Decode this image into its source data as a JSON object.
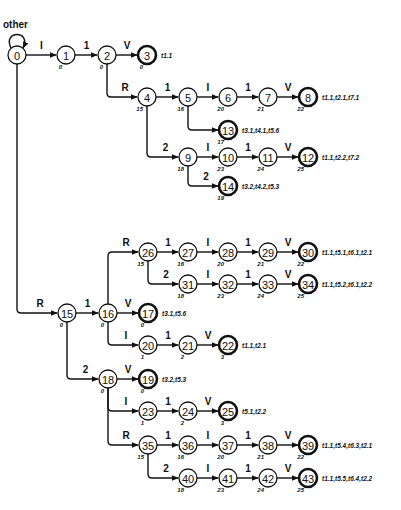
{
  "diagram": {
    "type": "finite-state-automaton",
    "self_loop_label": "other",
    "node_radius": 9,
    "colors": {
      "stroke": "#111111",
      "fill": "#ffffff",
      "text": "#111111"
    },
    "nodes": [
      {
        "id": "0",
        "x": 17,
        "y": 55,
        "sub": "",
        "final": false,
        "out": ""
      },
      {
        "id": "1",
        "x": 66,
        "y": 55,
        "sub": "0",
        "final": false,
        "out": ""
      },
      {
        "id": "2",
        "x": 107,
        "y": 55,
        "sub": "0",
        "final": false,
        "out": ""
      },
      {
        "id": "3",
        "x": 147,
        "y": 55,
        "sub": "0",
        "final": true,
        "out": "t1.1"
      },
      {
        "id": "4",
        "x": 147,
        "y": 97,
        "sub": "15",
        "final": false,
        "out": ""
      },
      {
        "id": "5",
        "x": 188,
        "y": 97,
        "sub": "16",
        "final": false,
        "out": ""
      },
      {
        "id": "6",
        "x": 228,
        "y": 97,
        "sub": "20",
        "final": false,
        "out": ""
      },
      {
        "id": "7",
        "x": 268,
        "y": 97,
        "sub": "21",
        "final": false,
        "out": ""
      },
      {
        "id": "8",
        "x": 308,
        "y": 97,
        "sub": "22",
        "final": true,
        "out": "t1.1,t2.1,t7.1"
      },
      {
        "id": "13",
        "x": 228,
        "y": 130,
        "sub": "17",
        "final": true,
        "out": "t3.1,t4.1,t5.6"
      },
      {
        "id": "9",
        "x": 188,
        "y": 157,
        "sub": "18",
        "final": false,
        "out": ""
      },
      {
        "id": "10",
        "x": 228,
        "y": 157,
        "sub": "23",
        "final": false,
        "out": ""
      },
      {
        "id": "11",
        "x": 268,
        "y": 157,
        "sub": "24",
        "final": false,
        "out": ""
      },
      {
        "id": "12",
        "x": 308,
        "y": 157,
        "sub": "25",
        "final": true,
        "out": "t1.1,t2.2,t7.2"
      },
      {
        "id": "14",
        "x": 228,
        "y": 186,
        "sub": "19",
        "final": true,
        "out": "t3.2,t4.2,t5.3"
      },
      {
        "id": "15",
        "x": 67,
        "y": 313,
        "sub": "0",
        "final": false,
        "out": ""
      },
      {
        "id": "16",
        "x": 108,
        "y": 313,
        "sub": "0",
        "final": false,
        "out": ""
      },
      {
        "id": "17",
        "x": 148,
        "y": 313,
        "sub": "0",
        "final": true,
        "out": "t3.1,t5.6"
      },
      {
        "id": "26",
        "x": 148,
        "y": 252,
        "sub": "15",
        "final": false,
        "out": ""
      },
      {
        "id": "27",
        "x": 188,
        "y": 252,
        "sub": "16",
        "final": false,
        "out": ""
      },
      {
        "id": "28",
        "x": 228,
        "y": 252,
        "sub": "20",
        "final": false,
        "out": ""
      },
      {
        "id": "29",
        "x": 268,
        "y": 252,
        "sub": "21",
        "final": false,
        "out": ""
      },
      {
        "id": "30",
        "x": 308,
        "y": 252,
        "sub": "22",
        "final": true,
        "out": "t1.1,t5.1,t6.1,t2.1"
      },
      {
        "id": "31",
        "x": 188,
        "y": 284,
        "sub": "18",
        "final": false,
        "out": ""
      },
      {
        "id": "32",
        "x": 228,
        "y": 284,
        "sub": "23",
        "final": false,
        "out": ""
      },
      {
        "id": "33",
        "x": 268,
        "y": 284,
        "sub": "24",
        "final": false,
        "out": ""
      },
      {
        "id": "34",
        "x": 308,
        "y": 284,
        "sub": "25",
        "final": true,
        "out": "t1.1,t5.2,t6.1,t2.2"
      },
      {
        "id": "20",
        "x": 148,
        "y": 345,
        "sub": "1",
        "final": false,
        "out": ""
      },
      {
        "id": "21",
        "x": 188,
        "y": 345,
        "sub": "2",
        "final": false,
        "out": ""
      },
      {
        "id": "22",
        "x": 228,
        "y": 345,
        "sub": "3",
        "final": true,
        "out": "t1.1,t2.1"
      },
      {
        "id": "18",
        "x": 108,
        "y": 379,
        "sub": "0",
        "final": false,
        "out": ""
      },
      {
        "id": "19",
        "x": 148,
        "y": 379,
        "sub": "0",
        "final": true,
        "out": "t3.2,t5.3"
      },
      {
        "id": "23",
        "x": 148,
        "y": 411,
        "sub": "1",
        "final": false,
        "out": ""
      },
      {
        "id": "24",
        "x": 188,
        "y": 411,
        "sub": "2",
        "final": false,
        "out": ""
      },
      {
        "id": "25",
        "x": 228,
        "y": 411,
        "sub": "3",
        "final": true,
        "out": "t5.1,t2.2"
      },
      {
        "id": "35",
        "x": 148,
        "y": 445,
        "sub": "15",
        "final": false,
        "out": ""
      },
      {
        "id": "36",
        "x": 188,
        "y": 445,
        "sub": "16",
        "final": false,
        "out": ""
      },
      {
        "id": "37",
        "x": 228,
        "y": 445,
        "sub": "20",
        "final": false,
        "out": ""
      },
      {
        "id": "38",
        "x": 268,
        "y": 445,
        "sub": "21",
        "final": false,
        "out": ""
      },
      {
        "id": "39",
        "x": 308,
        "y": 445,
        "sub": "22",
        "final": true,
        "out": "t1.1,t5.4,t6.3,t2.1"
      },
      {
        "id": "40",
        "x": 188,
        "y": 478,
        "sub": "18",
        "final": false,
        "out": ""
      },
      {
        "id": "41",
        "x": 228,
        "y": 478,
        "sub": "23",
        "final": false,
        "out": ""
      },
      {
        "id": "42",
        "x": 268,
        "y": 478,
        "sub": "24",
        "final": false,
        "out": ""
      },
      {
        "id": "43",
        "x": 308,
        "y": 478,
        "sub": "25",
        "final": true,
        "out": "t1.1,t5.5,t6.4,t2.2"
      }
    ],
    "edges": [
      {
        "from": "0",
        "to": "1",
        "label": "I",
        "kind": "straight"
      },
      {
        "from": "1",
        "to": "2",
        "label": "1",
        "kind": "straight"
      },
      {
        "from": "2",
        "to": "3",
        "label": "V",
        "kind": "straight"
      },
      {
        "from": "2",
        "to": "4",
        "label": "R",
        "kind": "elbow"
      },
      {
        "from": "4",
        "to": "5",
        "label": "1",
        "kind": "straight"
      },
      {
        "from": "5",
        "to": "6",
        "label": "I",
        "kind": "straight"
      },
      {
        "from": "6",
        "to": "7",
        "label": "1",
        "kind": "straight"
      },
      {
        "from": "7",
        "to": "8",
        "label": "V",
        "kind": "straight"
      },
      {
        "from": "5",
        "to": "13",
        "label": "",
        "kind": "elbow"
      },
      {
        "from": "4",
        "to": "9",
        "label": "2",
        "kind": "elbow"
      },
      {
        "from": "9",
        "to": "10",
        "label": "I",
        "kind": "straight"
      },
      {
        "from": "10",
        "to": "11",
        "label": "1",
        "kind": "straight"
      },
      {
        "from": "11",
        "to": "12",
        "label": "V",
        "kind": "straight"
      },
      {
        "from": "9",
        "to": "14",
        "label": "2",
        "kind": "elbow"
      },
      {
        "from": "0",
        "to": "15",
        "label": "R",
        "kind": "elbow"
      },
      {
        "from": "15",
        "to": "16",
        "label": "1",
        "kind": "straight"
      },
      {
        "from": "16",
        "to": "17",
        "label": "V",
        "kind": "straight"
      },
      {
        "from": "16",
        "to": "26",
        "label": "R",
        "kind": "elbow"
      },
      {
        "from": "26",
        "to": "27",
        "label": "1",
        "kind": "straight"
      },
      {
        "from": "27",
        "to": "28",
        "label": "I",
        "kind": "straight"
      },
      {
        "from": "28",
        "to": "29",
        "label": "1",
        "kind": "straight"
      },
      {
        "from": "29",
        "to": "30",
        "label": "V",
        "kind": "straight"
      },
      {
        "from": "26",
        "to": "31",
        "label": "2",
        "kind": "elbow"
      },
      {
        "from": "31",
        "to": "32",
        "label": "I",
        "kind": "straight"
      },
      {
        "from": "32",
        "to": "33",
        "label": "1",
        "kind": "straight"
      },
      {
        "from": "33",
        "to": "34",
        "label": "V",
        "kind": "straight"
      },
      {
        "from": "16",
        "to": "20",
        "label": "I",
        "kind": "elbow"
      },
      {
        "from": "20",
        "to": "21",
        "label": "1",
        "kind": "straight"
      },
      {
        "from": "21",
        "to": "22",
        "label": "V",
        "kind": "straight"
      },
      {
        "from": "15",
        "to": "18",
        "label": "2",
        "kind": "elbow"
      },
      {
        "from": "18",
        "to": "19",
        "label": "V",
        "kind": "straight"
      },
      {
        "from": "18",
        "to": "23",
        "label": "I",
        "kind": "elbow"
      },
      {
        "from": "23",
        "to": "24",
        "label": "1",
        "kind": "straight"
      },
      {
        "from": "24",
        "to": "25",
        "label": "V",
        "kind": "straight"
      },
      {
        "from": "18",
        "to": "35",
        "label": "R",
        "kind": "elbow"
      },
      {
        "from": "35",
        "to": "36",
        "label": "1",
        "kind": "straight"
      },
      {
        "from": "36",
        "to": "37",
        "label": "I",
        "kind": "straight"
      },
      {
        "from": "37",
        "to": "38",
        "label": "1",
        "kind": "straight"
      },
      {
        "from": "38",
        "to": "39",
        "label": "V",
        "kind": "straight"
      },
      {
        "from": "35",
        "to": "40",
        "label": "2",
        "kind": "elbow"
      },
      {
        "from": "40",
        "to": "41",
        "label": "I",
        "kind": "straight"
      },
      {
        "from": "41",
        "to": "42",
        "label": "1",
        "kind": "straight"
      },
      {
        "from": "42",
        "to": "43",
        "label": "V",
        "kind": "straight"
      }
    ]
  }
}
